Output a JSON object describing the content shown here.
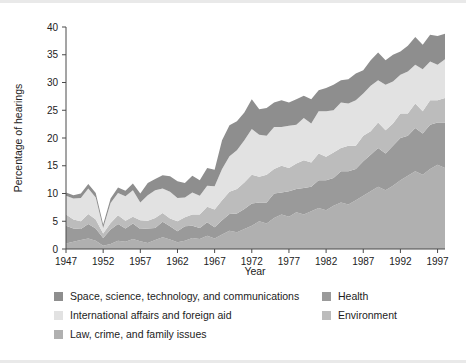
{
  "chart_data": {
    "type": "area",
    "stacked": true,
    "title": "",
    "xlabel": "Year",
    "ylabel": "Percentage of hearings",
    "xlim": [
      1947,
      1998
    ],
    "ylim": [
      0,
      40
    ],
    "yticks": [
      0,
      5,
      10,
      15,
      20,
      25,
      30,
      35,
      40
    ],
    "xticks": [
      1947,
      1952,
      1957,
      1962,
      1967,
      1972,
      1977,
      1982,
      1987,
      1992,
      1997
    ],
    "grid": false,
    "legend_position": "bottom",
    "x": [
      1947,
      1948,
      1949,
      1950,
      1951,
      1952,
      1953,
      1954,
      1955,
      1956,
      1957,
      1958,
      1959,
      1960,
      1961,
      1962,
      1963,
      1964,
      1965,
      1966,
      1967,
      1968,
      1969,
      1970,
      1971,
      1972,
      1973,
      1974,
      1975,
      1976,
      1977,
      1978,
      1979,
      1980,
      1981,
      1982,
      1983,
      1984,
      1985,
      1986,
      1987,
      1988,
      1989,
      1990,
      1991,
      1992,
      1993,
      1994,
      1995,
      1996,
      1997,
      1998
    ],
    "series": [
      {
        "name": "Law, crime, and family issues",
        "color": "#b0b0b0",
        "values": [
          1.0,
          1.3,
          1.6,
          1.9,
          1.5,
          0.6,
          0.9,
          1.5,
          1.3,
          1.8,
          1.4,
          1.1,
          1.6,
          2.1,
          1.7,
          1.2,
          1.5,
          2.0,
          1.8,
          2.4,
          1.9,
          2.6,
          3.3,
          3.0,
          3.6,
          4.2,
          5.0,
          4.6,
          5.6,
          6.2,
          5.8,
          6.6,
          6.2,
          6.8,
          7.4,
          7.0,
          7.8,
          8.4,
          8.0,
          8.8,
          9.6,
          10.4,
          11.2,
          10.6,
          11.4,
          12.4,
          13.2,
          14.0,
          13.4,
          14.4,
          15.2,
          14.6
        ]
      },
      {
        "name": "Health",
        "color": "#9a9a9a",
        "values": [
          3.2,
          2.4,
          2.0,
          2.6,
          2.2,
          1.4,
          2.6,
          3.0,
          2.4,
          2.8,
          2.2,
          2.6,
          2.2,
          2.8,
          2.4,
          2.0,
          2.6,
          2.2,
          2.0,
          2.4,
          2.0,
          2.6,
          3.0,
          3.4,
          3.6,
          4.0,
          3.4,
          3.8,
          4.4,
          4.0,
          4.6,
          4.2,
          4.8,
          4.4,
          5.0,
          5.4,
          5.0,
          5.6,
          6.0,
          5.6,
          6.2,
          6.6,
          7.0,
          6.6,
          7.2,
          7.6,
          7.2,
          7.8,
          7.4,
          8.0,
          7.6,
          8.2
        ]
      },
      {
        "name": "Environment",
        "color": "#bcbcbc",
        "values": [
          2.0,
          1.6,
          1.4,
          1.8,
          1.6,
          0.8,
          1.2,
          1.6,
          1.4,
          1.2,
          1.6,
          1.4,
          1.8,
          1.6,
          1.4,
          1.8,
          1.6,
          2.0,
          2.4,
          2.8,
          3.2,
          3.6,
          4.0,
          4.4,
          4.8,
          5.2,
          4.6,
          5.0,
          4.4,
          4.8,
          4.2,
          4.6,
          5.0,
          4.4,
          4.8,
          4.2,
          4.6,
          4.2,
          4.6,
          4.2,
          4.6,
          4.2,
          4.6,
          4.2,
          4.0,
          4.4,
          4.0,
          4.4,
          4.0,
          4.4,
          4.0,
          4.4
        ]
      },
      {
        "name": "International affairs and foreign aid",
        "color": "#e2e2e2",
        "values": [
          3.4,
          3.8,
          4.2,
          4.6,
          4.0,
          1.0,
          3.6,
          4.0,
          4.4,
          4.8,
          3.2,
          4.6,
          5.0,
          4.4,
          4.8,
          4.2,
          3.6,
          4.0,
          3.4,
          3.8,
          4.2,
          5.6,
          6.4,
          7.0,
          7.6,
          8.2,
          7.6,
          7.0,
          7.6,
          7.0,
          7.6,
          7.0,
          7.6,
          7.0,
          7.6,
          8.2,
          7.6,
          8.2,
          7.6,
          8.2,
          7.6,
          8.2,
          7.6,
          8.2,
          7.6,
          7.0,
          7.6,
          7.0,
          7.6,
          7.0,
          6.4,
          7.0
        ]
      },
      {
        "name": "Space, science, technology, and communications",
        "color": "#8e8e8e",
        "values": [
          0.6,
          0.6,
          0.8,
          0.8,
          0.8,
          0.6,
          0.8,
          1.0,
          1.0,
          1.2,
          1.6,
          2.2,
          2.0,
          2.4,
          2.8,
          3.0,
          2.6,
          3.0,
          2.8,
          3.2,
          3.0,
          5.2,
          5.6,
          5.2,
          5.0,
          5.4,
          4.6,
          5.0,
          4.4,
          4.8,
          4.2,
          4.6,
          4.0,
          4.4,
          3.8,
          4.2,
          4.6,
          4.0,
          4.4,
          4.8,
          4.2,
          4.6,
          5.0,
          4.4,
          4.8,
          4.2,
          4.6,
          5.0,
          4.4,
          4.8,
          5.2,
          4.6
        ]
      }
    ]
  },
  "axes": {
    "ylabel": "Percentage of hearings",
    "xlabel": "Year",
    "ytick_labels": [
      "0",
      "5",
      "10",
      "15",
      "20",
      "25",
      "30",
      "35",
      "40"
    ],
    "xtick_labels": [
      "1947",
      "1952",
      "1957",
      "1962",
      "1967",
      "1972",
      "1977",
      "1982",
      "1987",
      "1992",
      "1997"
    ]
  },
  "legend": {
    "left_column": [
      {
        "label": "Space, science, technology, and communications",
        "color": "#8e8e8e"
      },
      {
        "label": "International affairs and foreign aid",
        "color": "#e2e2e2"
      },
      {
        "label": "Law, crime, and family issues",
        "color": "#b0b0b0"
      }
    ],
    "right_column": [
      {
        "label": "Health",
        "color": "#9a9a9a"
      },
      {
        "label": "Environment",
        "color": "#bcbcbc"
      }
    ]
  }
}
